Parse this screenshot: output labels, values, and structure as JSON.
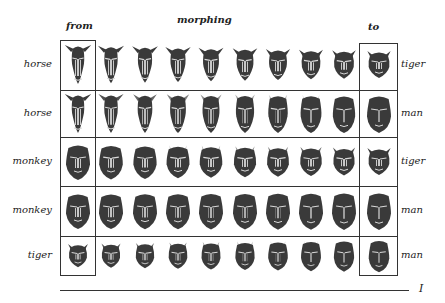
{
  "headers": {
    "from": "from",
    "morphing": "morphing",
    "to": "to"
  },
  "rows": [
    {
      "from": "horse",
      "to": "tiger",
      "fromType": "horse",
      "toType": "tiger"
    },
    {
      "from": "horse",
      "to": "man",
      "fromType": "horse",
      "toType": "man"
    },
    {
      "from": "monkey",
      "to": "tiger",
      "fromType": "monkey",
      "toType": "tiger"
    },
    {
      "from": "monkey",
      "to": "man",
      "fromType": "monkey",
      "toType": "man"
    },
    {
      "from": "tiger",
      "to": "man",
      "fromType": "tiger",
      "toType": "man"
    }
  ],
  "steps": 10,
  "page_marker": "I",
  "colors": {
    "face": "#3a3a3a",
    "feature": "#d8d8d8",
    "line": "#333333"
  }
}
